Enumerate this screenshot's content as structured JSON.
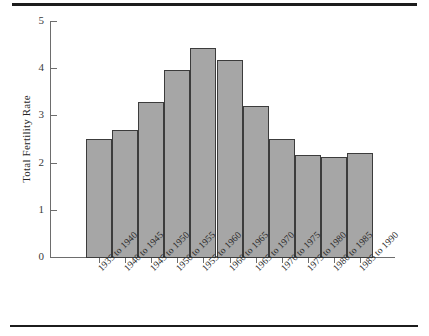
{
  "chart_data": {
    "type": "bar",
    "title": "",
    "xlabel": "",
    "ylabel": "Total Fertility Rate",
    "ylim": [
      0,
      5
    ],
    "yticks": [
      "0",
      "1",
      "2",
      "3",
      "4",
      "5"
    ],
    "grid": false,
    "legend": null,
    "categories": [
      "1935 to 1940",
      "1940 to 1945",
      "1945 to 1950",
      "1950 to 1955",
      "1955 to 1960",
      "1960 to 1965",
      "1965 to 1970",
      "1970 to 1975",
      "1975 to 1980",
      "1980 to 1985",
      "1985 to 1990"
    ],
    "values": [
      2.53,
      2.72,
      3.3,
      3.98,
      4.45,
      4.19,
      3.23,
      2.52,
      2.19,
      2.15,
      2.23
    ],
    "bar_color": "#a6a6a6",
    "bar_edge_color": "#3c3c3c",
    "axis_color": "#6d6d6d",
    "text_color": "#262626"
  }
}
